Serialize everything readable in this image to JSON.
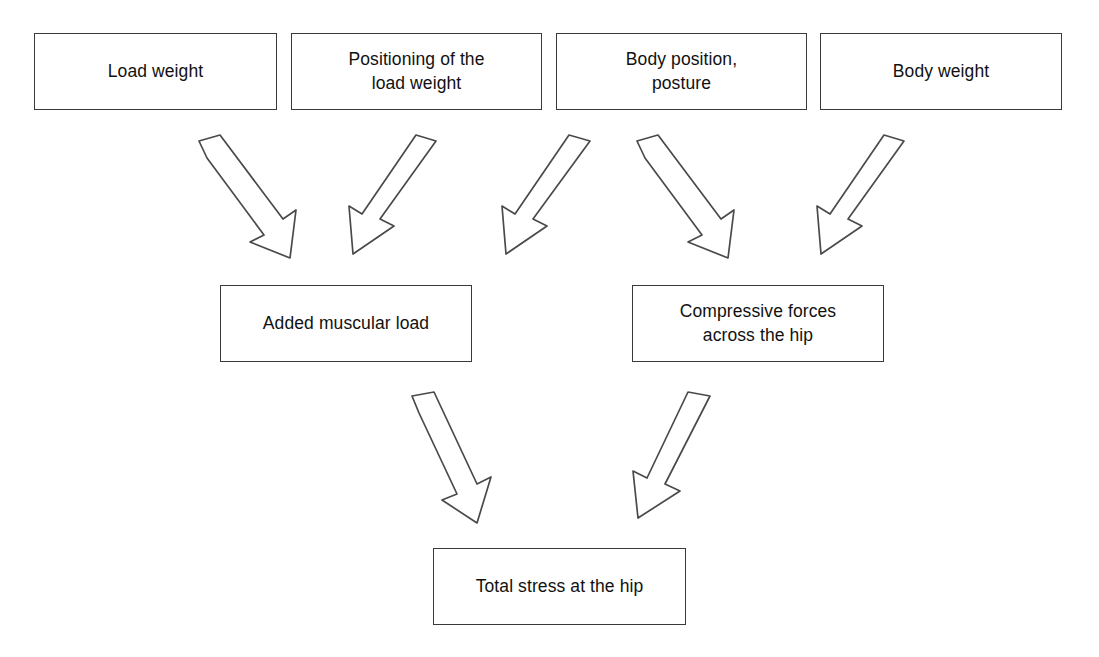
{
  "diagram": {
    "type": "flowchart",
    "canvas": {
      "width": 1099,
      "height": 657
    },
    "style": {
      "background_color": "#ffffff",
      "box_border_color": "#3a3a3a",
      "box_fill_color": "#ffffff",
      "arrow_stroke_color": "#4a4a4a",
      "arrow_fill_color": "#ffffff",
      "text_color": "#111111"
    },
    "levels": [
      {
        "name": "inputs",
        "label": "Input factors"
      },
      {
        "name": "intermediate",
        "label": "Intermediate effects"
      },
      {
        "name": "outcome",
        "label": "Outcome"
      }
    ],
    "nodes": [
      {
        "id": "load-weight",
        "label": "Load weight",
        "level": "inputs",
        "x": 34,
        "y": 33,
        "w": 243,
        "h": 77
      },
      {
        "id": "positioning",
        "label": "Positioning of the\nload weight",
        "level": "inputs",
        "x": 291,
        "y": 33,
        "w": 251,
        "h": 77
      },
      {
        "id": "body-position",
        "label": "Body position,\nposture",
        "level": "inputs",
        "x": 556,
        "y": 33,
        "w": 251,
        "h": 77
      },
      {
        "id": "body-weight",
        "label": "Body weight",
        "level": "inputs",
        "x": 820,
        "y": 33,
        "w": 242,
        "h": 77
      },
      {
        "id": "added-muscular-load",
        "label": "Added muscular load",
        "level": "intermediate",
        "x": 220,
        "y": 285,
        "w": 252,
        "h": 77
      },
      {
        "id": "compressive-forces",
        "label": "Compressive forces\nacross the hip",
        "level": "intermediate",
        "x": 632,
        "y": 285,
        "w": 252,
        "h": 77
      },
      {
        "id": "total-stress",
        "label": "Total stress at the hip",
        "level": "outcome",
        "x": 433,
        "y": 548,
        "w": 253,
        "h": 77
      }
    ],
    "edges": [
      {
        "id": "e1",
        "from": "load-weight",
        "to": "added-muscular-load",
        "direction": "down-right"
      },
      {
        "id": "e2",
        "from": "positioning",
        "to": "added-muscular-load",
        "direction": "down-left"
      },
      {
        "id": "e3",
        "from": "body-position",
        "to": "added-muscular-load",
        "direction": "down-left"
      },
      {
        "id": "e4",
        "from": "body-position",
        "to": "compressive-forces",
        "direction": "down-right"
      },
      {
        "id": "e5",
        "from": "body-weight",
        "to": "compressive-forces",
        "direction": "down-left"
      },
      {
        "id": "e6",
        "from": "added-muscular-load",
        "to": "total-stress",
        "direction": "down-right"
      },
      {
        "id": "e7",
        "from": "compressive-forces",
        "to": "total-stress",
        "direction": "down-left"
      }
    ]
  }
}
